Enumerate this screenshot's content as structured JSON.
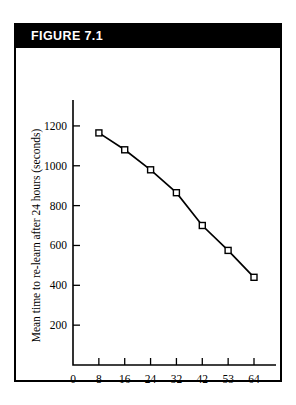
{
  "figure": {
    "header_label": "FIGURE 7.1"
  },
  "chart_data": {
    "type": "line",
    "title": "",
    "xlabel": "No. of repetitions on day 1",
    "ylabel": "Mean time to re-learn after 24 hours (seconds)",
    "x": [
      8,
      16,
      24,
      32,
      42,
      53,
      64
    ],
    "values": [
      1165,
      1080,
      980,
      865,
      700,
      575,
      440
    ],
    "xtick_labels": [
      "0",
      "8",
      "16",
      "24",
      "32",
      "42",
      "53",
      "64"
    ],
    "ytick_labels": [
      "200",
      "400",
      "600",
      "800",
      "1000",
      "1200"
    ],
    "ylim": [
      0,
      1300
    ],
    "grid": false,
    "legend": "none",
    "marker": "open-square",
    "line_color": "#000000",
    "marker_fill": "#ffffff"
  }
}
